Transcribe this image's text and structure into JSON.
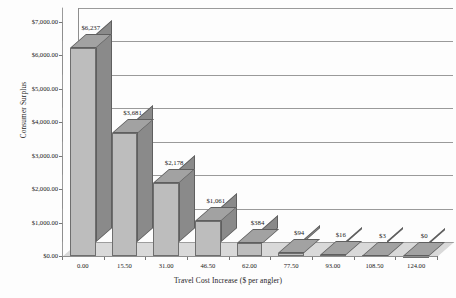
{
  "chart_data": {
    "type": "bar",
    "title": "",
    "xlabel": "Travel Cost Increase ($ per angler)",
    "ylabel": "Consumer Surplus",
    "categories": [
      "0.00",
      "15.50",
      "31.00",
      "46.50",
      "62.00",
      "77.50",
      "93.00",
      "108.50",
      "124.00"
    ],
    "values": [
      6237,
      3681,
      2178,
      1061,
      384,
      94,
      16,
      3,
      0
    ],
    "data_labels": [
      "$6,237",
      "$3,681",
      "$2,178",
      "$1,061",
      "$384",
      "$94",
      "$16",
      "$3",
      "$0"
    ],
    "ylim": [
      0,
      7000
    ],
    "ytick_values": [
      0,
      1000,
      2000,
      3000,
      4000,
      5000,
      6000,
      7000
    ],
    "ytick_labels": [
      "$0.00",
      "$1,000.00",
      "$2,000.00",
      "$3,000.00",
      "$4,000.00",
      "$5,000.00",
      "$6,000.00",
      "$7,000.00"
    ],
    "grid": true,
    "legend": "none",
    "style": "3d-column",
    "colors": {
      "bar_front": "#bdbdbd",
      "bar_side": "#8a8a8a",
      "bar_top": "#a2a2a2",
      "gridline": "#9a9a9a",
      "floor": "#d9d9d9",
      "background": "#fdfdfd",
      "text": "#1a1a1a"
    }
  }
}
